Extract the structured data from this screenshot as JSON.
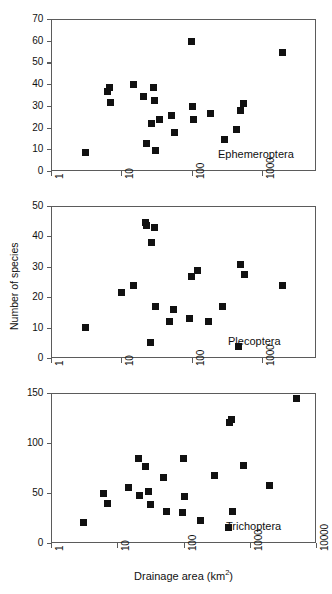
{
  "figure": {
    "xlabel_text": "Drainage area (km",
    "xlabel_unit": "2",
    "xlabel_close": ")",
    "ylabel": "Number of species"
  },
  "chart_data": [
    {
      "type": "scatter",
      "title": "Ephemeroptera",
      "series_label": "Ephemeroptera",
      "xlabel": "Drainage area (km2)",
      "ylabel": "Number of species",
      "xscale": "log",
      "xlim": [
        1,
        5900
      ],
      "ylim": [
        0,
        70
      ],
      "xticks": [
        1,
        10,
        100,
        1000
      ],
      "xticklabels": [
        "1",
        "10",
        "100",
        "1000"
      ],
      "yticks": [
        0,
        10,
        20,
        30,
        40,
        50,
        60,
        70
      ],
      "yticklabels": [
        "0",
        "10",
        "20",
        "30",
        "40",
        "50",
        "60",
        "70"
      ],
      "grid": false,
      "marker": "square",
      "marker_color": "#111111",
      "points": [
        {
          "x": 3.1,
          "y": 8.5
        },
        {
          "x": 6.3,
          "y": 36.6
        },
        {
          "x": 6.9,
          "y": 38.5
        },
        {
          "x": 7.1,
          "y": 31.5
        },
        {
          "x": 15.0,
          "y": 39.7
        },
        {
          "x": 21.0,
          "y": 34.5
        },
        {
          "x": 23.0,
          "y": 12.5
        },
        {
          "x": 27.0,
          "y": 22.0
        },
        {
          "x": 29.0,
          "y": 38.5
        },
        {
          "x": 30.0,
          "y": 32.3
        },
        {
          "x": 31.0,
          "y": 9.6
        },
        {
          "x": 35.0,
          "y": 23.5
        },
        {
          "x": 52.0,
          "y": 25.5
        },
        {
          "x": 57.0,
          "y": 17.7
        },
        {
          "x": 100.0,
          "y": 59.8
        },
        {
          "x": 103.0,
          "y": 29.5
        },
        {
          "x": 107.0,
          "y": 23.8
        },
        {
          "x": 185.0,
          "y": 26.5
        },
        {
          "x": 290.0,
          "y": 14.6
        },
        {
          "x": 430.0,
          "y": 18.9
        },
        {
          "x": 500.0,
          "y": 27.7
        },
        {
          "x": 540.0,
          "y": 31.3
        },
        {
          "x": 1950.0,
          "y": 54.5
        }
      ]
    },
    {
      "type": "scatter",
      "title": "Plecoptera",
      "series_label": "Plecoptera",
      "xlabel": "Drainage area (km2)",
      "ylabel": "Number of species",
      "xscale": "log",
      "xlim": [
        1,
        5900
      ],
      "ylim": [
        0,
        50
      ],
      "xticks": [
        1,
        10,
        100,
        1000
      ],
      "xticklabels": [
        "1",
        "10",
        "100",
        "1000"
      ],
      "yticks": [
        0,
        10,
        20,
        30,
        40,
        50
      ],
      "yticklabels": [
        "0",
        "10",
        "20",
        "30",
        "40",
        "50"
      ],
      "grid": false,
      "marker": "square",
      "marker_color": "#111111",
      "points": [
        {
          "x": 3.1,
          "y": 9.9
        },
        {
          "x": 10.0,
          "y": 21.7
        },
        {
          "x": 15.0,
          "y": 23.8
        },
        {
          "x": 22.0,
          "y": 44.5
        },
        {
          "x": 22.5,
          "y": 43.5
        },
        {
          "x": 26.0,
          "y": 5.0
        },
        {
          "x": 27.0,
          "y": 37.9
        },
        {
          "x": 30.0,
          "y": 42.8
        },
        {
          "x": 31.0,
          "y": 16.9
        },
        {
          "x": 48.0,
          "y": 11.9
        },
        {
          "x": 55.0,
          "y": 15.9
        },
        {
          "x": 95.0,
          "y": 13.0
        },
        {
          "x": 100.0,
          "y": 26.8
        },
        {
          "x": 120.0,
          "y": 28.7
        },
        {
          "x": 175.0,
          "y": 11.9
        },
        {
          "x": 280.0,
          "y": 16.8
        },
        {
          "x": 470.0,
          "y": 3.8
        },
        {
          "x": 500.0,
          "y": 30.8
        },
        {
          "x": 560.0,
          "y": 27.5
        },
        {
          "x": 1950.0,
          "y": 23.7
        }
      ]
    },
    {
      "type": "scatter",
      "title": "Trichoptera",
      "series_label": "Trichoptera",
      "xlabel": "Drainage area (km2)",
      "ylabel": "Number of species",
      "xscale": "log",
      "xlim": [
        1,
        10000
      ],
      "ylim": [
        0,
        150
      ],
      "xticks": [
        1,
        10,
        100,
        1000,
        10000
      ],
      "xticklabels": [
        "1",
        "10",
        "100",
        "1000",
        "10000"
      ],
      "yticks": [
        0,
        50,
        100,
        150
      ],
      "yticklabels": [
        "0",
        "50",
        "100",
        "150"
      ],
      "grid": false,
      "marker": "square",
      "marker_color": "#111111",
      "points": [
        {
          "x": 3.1,
          "y": 20.5
        },
        {
          "x": 6.3,
          "y": 49.5
        },
        {
          "x": 7.2,
          "y": 39.5
        },
        {
          "x": 15.0,
          "y": 56.0
        },
        {
          "x": 21.0,
          "y": 85.0
        },
        {
          "x": 22.0,
          "y": 48.0
        },
        {
          "x": 27.0,
          "y": 77.0
        },
        {
          "x": 30.0,
          "y": 51.5
        },
        {
          "x": 32.0,
          "y": 39.0
        },
        {
          "x": 50.0,
          "y": 65.5
        },
        {
          "x": 55.0,
          "y": 32.0
        },
        {
          "x": 95.0,
          "y": 30.5
        },
        {
          "x": 100.0,
          "y": 85.0
        },
        {
          "x": 105.0,
          "y": 46.5
        },
        {
          "x": 180.0,
          "y": 23.0
        },
        {
          "x": 290.0,
          "y": 67.5
        },
        {
          "x": 480.0,
          "y": 15.5
        },
        {
          "x": 500.0,
          "y": 121.0
        },
        {
          "x": 530.0,
          "y": 124.0
        },
        {
          "x": 540.0,
          "y": 32.0
        },
        {
          "x": 800.0,
          "y": 78.0
        },
        {
          "x": 2000.0,
          "y": 57.5
        },
        {
          "x": 5000.0,
          "y": 145.0
        }
      ]
    }
  ]
}
